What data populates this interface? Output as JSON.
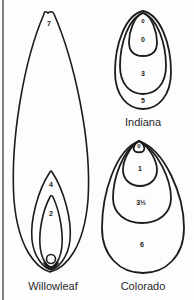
{
  "figure": {
    "type": "spinner blade shapes and sizes"
  },
  "blades": [
    {
      "name": "Willowleaf",
      "sizes": [
        "7",
        "4",
        "2",
        "0"
      ]
    },
    {
      "name": "Indiana",
      "sizes": [
        "0",
        "0",
        "3",
        "5"
      ]
    },
    {
      "name": "Colorado",
      "sizes": [
        "0",
        "1",
        "3½",
        "6"
      ]
    }
  ],
  "colors": {
    "outline": "#1c1c1c",
    "border": "#555555",
    "background": "#fdfdfd"
  }
}
